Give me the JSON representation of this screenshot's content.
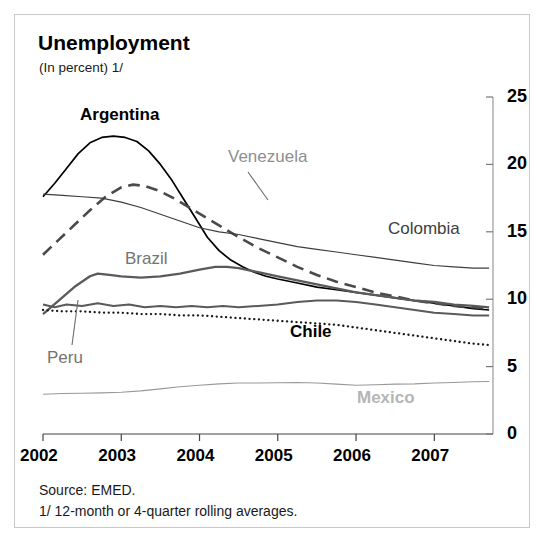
{
  "figure": {
    "title": "Unemployment",
    "subtitle": "(In percent) 1/",
    "source": "Source:  EMED.",
    "note": "1/ 12-month or 4-quarter rolling averages."
  },
  "chart_data": {
    "type": "line",
    "title": "Unemployment",
    "subtitle": "(In percent) 1/",
    "xlabel": "",
    "ylabel": "",
    "xlim": [
      2002.0,
      2007.75
    ],
    "ylim": [
      0,
      25
    ],
    "yticks": [
      0,
      5,
      10,
      15,
      20,
      25
    ],
    "xticks": [
      2002,
      2003,
      2004,
      2005,
      2006,
      2007
    ],
    "grid": false,
    "legend": "inline-labels",
    "y_axis_position": "right",
    "series": [
      {
        "name": "Argentina",
        "color": "#000000",
        "style": "solid",
        "width": 1.7,
        "label_color": "#000000",
        "x": [
          2002.0,
          2002.15,
          2002.3,
          2002.45,
          2002.6,
          2002.75,
          2002.9,
          2003.05,
          2003.2,
          2003.35,
          2003.5,
          2003.65,
          2003.8,
          2003.95,
          2004.1,
          2004.25,
          2004.4,
          2004.55,
          2004.7,
          2004.85,
          2005.0,
          2005.25,
          2005.5,
          2005.75,
          2006.0,
          2006.25,
          2006.5,
          2006.75,
          2007.0,
          2007.25,
          2007.5,
          2007.7
        ],
        "y": [
          17.6,
          18.6,
          19.7,
          20.8,
          21.6,
          22.0,
          22.1,
          22.0,
          21.7,
          21.0,
          20.0,
          18.8,
          17.4,
          16.0,
          14.6,
          13.6,
          12.9,
          12.4,
          12.0,
          11.7,
          11.5,
          11.2,
          10.9,
          10.7,
          10.5,
          10.3,
          10.1,
          9.9,
          9.7,
          9.5,
          9.3,
          9.2
        ]
      },
      {
        "name": "Venezuela",
        "color": "#4a4a4a",
        "style": "dashed",
        "width": 2.6,
        "label_color": "#8e8e8e",
        "x": [
          2002.0,
          2002.2,
          2002.4,
          2002.6,
          2002.8,
          2003.0,
          2003.15,
          2003.3,
          2003.5,
          2003.7,
          2003.9,
          2004.1,
          2004.3,
          2004.5,
          2004.75,
          2005.0,
          2005.25,
          2005.5,
          2005.75,
          2006.0,
          2006.25,
          2006.5,
          2006.75,
          2007.0,
          2007.25,
          2007.5,
          2007.7
        ],
        "y": [
          13.3,
          14.4,
          15.5,
          16.6,
          17.6,
          18.3,
          18.5,
          18.4,
          18.0,
          17.4,
          16.7,
          16.0,
          15.3,
          14.6,
          13.8,
          13.1,
          12.4,
          11.8,
          11.3,
          10.9,
          10.5,
          10.2,
          9.9,
          9.7,
          9.5,
          9.4,
          9.3
        ]
      },
      {
        "name": "Colombia",
        "color": "#3d3d3d",
        "style": "solid",
        "width": 1.2,
        "label_color": "#3d3d3d",
        "x": [
          2002.0,
          2002.25,
          2002.5,
          2002.75,
          2003.0,
          2003.25,
          2003.5,
          2003.75,
          2004.0,
          2004.25,
          2004.5,
          2004.75,
          2005.0,
          2005.25,
          2005.5,
          2005.75,
          2006.0,
          2006.25,
          2006.5,
          2006.75,
          2007.0,
          2007.25,
          2007.5,
          2007.7
        ],
        "y": [
          17.8,
          17.7,
          17.6,
          17.5,
          17.2,
          16.8,
          16.3,
          15.8,
          15.3,
          15.0,
          14.8,
          14.5,
          14.2,
          13.9,
          13.7,
          13.5,
          13.3,
          13.1,
          12.9,
          12.7,
          12.5,
          12.4,
          12.3,
          12.3
        ]
      },
      {
        "name": "Brazil",
        "color": "#5a5a5a",
        "style": "solid",
        "width": 2.3,
        "label_color": "#737373",
        "x": [
          2002.0,
          2002.2,
          2002.4,
          2002.6,
          2002.7,
          2002.85,
          2003.0,
          2003.25,
          2003.5,
          2003.75,
          2004.0,
          2004.2,
          2004.35,
          2004.5,
          2004.75,
          2005.0,
          2005.25,
          2005.5,
          2005.75,
          2006.0,
          2006.25,
          2006.5,
          2006.75,
          2007.0,
          2007.25,
          2007.5,
          2007.7
        ],
        "y": [
          8.9,
          9.9,
          10.9,
          11.7,
          11.9,
          11.8,
          11.7,
          11.6,
          11.7,
          11.9,
          12.2,
          12.4,
          12.4,
          12.3,
          12.0,
          11.7,
          11.4,
          11.1,
          10.8,
          10.5,
          10.3,
          10.1,
          9.9,
          9.8,
          9.6,
          9.5,
          9.4
        ]
      },
      {
        "name": "Peru",
        "color": "#5a5a5a",
        "style": "solid",
        "width": 2.0,
        "label_color": "#737373",
        "x": [
          2002.0,
          2002.15,
          2002.3,
          2002.5,
          2002.7,
          2002.9,
          2003.1,
          2003.3,
          2003.5,
          2003.7,
          2003.9,
          2004.1,
          2004.3,
          2004.5,
          2004.75,
          2005.0,
          2005.25,
          2005.5,
          2005.75,
          2006.0,
          2006.25,
          2006.5,
          2006.75,
          2007.0,
          2007.25,
          2007.5,
          2007.7
        ],
        "y": [
          9.6,
          9.4,
          9.6,
          9.5,
          9.7,
          9.5,
          9.6,
          9.4,
          9.5,
          9.4,
          9.5,
          9.4,
          9.5,
          9.4,
          9.5,
          9.6,
          9.8,
          9.9,
          9.9,
          9.8,
          9.6,
          9.4,
          9.2,
          9.0,
          8.9,
          8.8,
          8.8
        ]
      },
      {
        "name": "Chile",
        "color": "#1a1a1a",
        "style": "dotted",
        "width": 2.3,
        "label_color": "#000000",
        "x": [
          2002.0,
          2002.25,
          2002.5,
          2002.75,
          2003.0,
          2003.25,
          2003.5,
          2003.75,
          2004.0,
          2004.25,
          2004.5,
          2004.75,
          2005.0,
          2005.25,
          2005.5,
          2005.75,
          2006.0,
          2006.25,
          2006.5,
          2006.75,
          2007.0,
          2007.25,
          2007.5,
          2007.7
        ],
        "y": [
          9.2,
          9.1,
          9.1,
          9.0,
          9.0,
          8.9,
          8.9,
          8.8,
          8.8,
          8.7,
          8.6,
          8.5,
          8.4,
          8.3,
          8.2,
          8.1,
          7.9,
          7.7,
          7.5,
          7.3,
          7.1,
          6.9,
          6.7,
          6.6
        ]
      },
      {
        "name": "Mexico",
        "color": "#999999",
        "style": "solid",
        "width": 1.1,
        "label_color": "#b5b5b5",
        "x": [
          2002.0,
          2002.25,
          2002.5,
          2002.75,
          2003.0,
          2003.25,
          2003.5,
          2003.75,
          2004.0,
          2004.25,
          2004.5,
          2004.75,
          2005.0,
          2005.25,
          2005.5,
          2005.75,
          2006.0,
          2006.25,
          2006.5,
          2006.75,
          2007.0,
          2007.25,
          2007.5,
          2007.7
        ],
        "y": [
          2.95,
          3.0,
          3.02,
          3.05,
          3.1,
          3.2,
          3.35,
          3.5,
          3.62,
          3.72,
          3.78,
          3.78,
          3.8,
          3.82,
          3.78,
          3.7,
          3.62,
          3.65,
          3.7,
          3.72,
          3.78,
          3.82,
          3.88,
          3.9
        ]
      }
    ],
    "annotations": [
      {
        "name": "Argentina",
        "x": 80,
        "y": 105,
        "leader": null
      },
      {
        "name": "Venezuela",
        "x": 228,
        "y": 147,
        "leader": {
          "x1": 248,
          "y1": 172,
          "x2": 268,
          "y2": 200
        }
      },
      {
        "name": "Colombia",
        "x": 388,
        "y": 219,
        "leader": null
      },
      {
        "name": "Brazil",
        "x": 125,
        "y": 249,
        "leader": null
      },
      {
        "name": "Peru",
        "x": 47,
        "y": 348,
        "leader": {
          "x1": 72,
          "y1": 345,
          "x2": 78,
          "y2": 300
        }
      },
      {
        "name": "Chile",
        "x": 290,
        "y": 322,
        "leader": null
      },
      {
        "name": "Mexico",
        "x": 357,
        "y": 388,
        "leader": null
      }
    ]
  },
  "axis": {
    "y_labels": [
      "25",
      "20",
      "15",
      "10",
      "5",
      "0"
    ],
    "x_labels": [
      "2002",
      "2003",
      "2004",
      "2005",
      "2006",
      "2007"
    ]
  }
}
